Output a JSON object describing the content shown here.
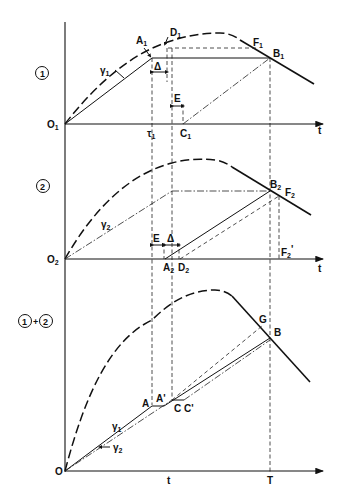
{
  "panels": [
    {
      "id": "panel-1",
      "tag": "①",
      "origin": {
        "main": "O",
        "sub": "1"
      },
      "axis_label": "t",
      "labels": {
        "A1": {
          "main": "A",
          "sub": "1"
        },
        "D1": {
          "main": "D",
          "sub": "1"
        },
        "F1": {
          "main": "F",
          "sub": "1"
        },
        "B1": {
          "main": "B",
          "sub": "1"
        },
        "gamma1": {
          "main": "γ",
          "sub": "1"
        },
        "delta": "Δ",
        "E": "E",
        "tau1": {
          "main": "τ",
          "sub": "1"
        },
        "C1": {
          "main": "C",
          "sub": "1"
        }
      }
    },
    {
      "id": "panel-2",
      "tag": "②",
      "origin": {
        "main": "O",
        "sub": "2"
      },
      "axis_label": "t",
      "labels": {
        "B2": {
          "main": "B",
          "sub": "2"
        },
        "F2": {
          "main": "F",
          "sub": "2"
        },
        "gamma2": {
          "main": "γ",
          "sub": "2"
        },
        "E": "E",
        "delta": "Δ",
        "A2": {
          "main": "A",
          "sub": "2"
        },
        "D2": {
          "main": "D",
          "sub": "2"
        },
        "F2prime": {
          "main": "F",
          "sub": "2",
          "prime": "'"
        }
      }
    },
    {
      "id": "panel-sum",
      "tag": "①+②",
      "origin": {
        "main": "O"
      },
      "axis_labels": {
        "t": "t",
        "T": "T"
      },
      "labels": {
        "G": "G",
        "B": "B",
        "A": "A",
        "Aprime": "A'",
        "C": "C",
        "Cprime": "C'",
        "gamma1": {
          "main": "γ",
          "sub": "1"
        },
        "gamma2": {
          "main": "γ",
          "sub": "2"
        }
      }
    }
  ]
}
